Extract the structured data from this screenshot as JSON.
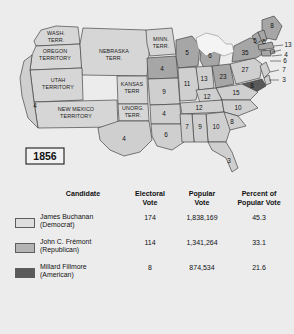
{
  "figure": {
    "year_label": "1856",
    "background_color": "#ececed"
  },
  "map": {
    "title": "1856 United States presidential election electoral map",
    "territory_labels": [
      {
        "name": "washington-territory",
        "lines": [
          "WASH.",
          "TERR."
        ]
      },
      {
        "name": "oregon-territory",
        "lines": [
          "OREGON",
          "TERRITORY"
        ]
      },
      {
        "name": "nebraska-territory",
        "lines": [
          "NEBRASKA",
          "TERR."
        ]
      },
      {
        "name": "minnesota-territory",
        "lines": [
          "MINN.",
          "TERR."
        ]
      },
      {
        "name": "utah-territory",
        "lines": [
          "UTAH",
          "TERRITORY"
        ]
      },
      {
        "name": "kansas-territory",
        "lines": [
          "KANSAS",
          "TERR"
        ]
      },
      {
        "name": "unorganized-territory",
        "lines": [
          "UNORG.",
          "TERR."
        ]
      },
      {
        "name": "new-mexico-territory",
        "lines": [
          "NEW MEXICO",
          "TERRITORY"
        ]
      }
    ],
    "electoral_votes": [
      {
        "state": "california",
        "value": "4",
        "winner": "buchanan"
      },
      {
        "state": "iowa",
        "value": "4",
        "winner": "fremont"
      },
      {
        "state": "wisconsin",
        "value": "5",
        "winner": "fremont"
      },
      {
        "state": "michigan",
        "value": "6",
        "winner": "fremont"
      },
      {
        "state": "missouri",
        "value": "9",
        "winner": "buchanan"
      },
      {
        "state": "illinois",
        "value": "11",
        "winner": "buchanan"
      },
      {
        "state": "indiana",
        "value": "13",
        "winner": "buchanan"
      },
      {
        "state": "ohio",
        "value": "23",
        "winner": "fremont"
      },
      {
        "state": "pennsylvania",
        "value": "27",
        "winner": "buchanan"
      },
      {
        "state": "new-york",
        "value": "35",
        "winner": "fremont"
      },
      {
        "state": "vermont",
        "value": "5",
        "winner": "fremont"
      },
      {
        "state": "new-hampshire",
        "value": "5",
        "winner": "fremont"
      },
      {
        "state": "maine",
        "value": "8",
        "winner": "fremont"
      },
      {
        "state": "massachusetts",
        "value": "13",
        "winner": "fremont"
      },
      {
        "state": "rhode-island",
        "value": "4",
        "winner": "fremont"
      },
      {
        "state": "connecticut",
        "value": "6",
        "winner": "fremont"
      },
      {
        "state": "new-jersey",
        "value": "7",
        "winner": "buchanan"
      },
      {
        "state": "delaware",
        "value": "3",
        "winner": "buchanan"
      },
      {
        "state": "maryland",
        "value": "8",
        "winner": "fillmore"
      },
      {
        "state": "virginia",
        "value": "15",
        "winner": "buchanan"
      },
      {
        "state": "kentucky",
        "value": "12",
        "winner": "buchanan"
      },
      {
        "state": "tennessee",
        "value": "12",
        "winner": "buchanan"
      },
      {
        "state": "north-carolina",
        "value": "10",
        "winner": "buchanan"
      },
      {
        "state": "south-carolina",
        "value": "8",
        "winner": "buchanan"
      },
      {
        "state": "georgia",
        "value": "10",
        "winner": "buchanan"
      },
      {
        "state": "alabama",
        "value": "9",
        "winner": "buchanan"
      },
      {
        "state": "mississippi",
        "value": "7",
        "winner": "buchanan"
      },
      {
        "state": "louisiana",
        "value": "6",
        "winner": "buchanan"
      },
      {
        "state": "arkansas",
        "value": "4",
        "winner": "buchanan"
      },
      {
        "state": "texas",
        "value": "4",
        "winner": "buchanan"
      },
      {
        "state": "florida",
        "value": "3",
        "winner": "buchanan"
      }
    ],
    "colors": {
      "buchanan": "#cfcfcf",
      "fremont": "#a6a6a6",
      "fillmore": "#5a5a5a",
      "territory": "#d6d6d6",
      "water": "#f4f4f4",
      "outline": "#3a3a3a"
    }
  },
  "table": {
    "headers": {
      "candidate": "Candidate",
      "electoral_vote_l1": "Electoral",
      "electoral_vote_l2": "Vote",
      "popular_vote_l1": "Popular",
      "popular_vote_l2": "Vote",
      "percent_l1": "Percent of",
      "percent_l2": "Popular Vote"
    },
    "rows": [
      {
        "swatch_color": "#dedede",
        "name": "James Buchanan",
        "party": "(Democrat)",
        "electoral_vote": "174",
        "popular_vote": "1,838,169",
        "percent_popular_vote": "45.3"
      },
      {
        "swatch_color": "#b4b4b4",
        "name": "John C. Frémont",
        "party": "(Republican)",
        "electoral_vote": "114",
        "popular_vote": "1,341,264",
        "percent_popular_vote": "33.1"
      },
      {
        "swatch_color": "#5a5a5a",
        "name": "Millard Fillmore",
        "party": "(American)",
        "electoral_vote": "8",
        "popular_vote": "874,534",
        "percent_popular_vote": "21.6"
      }
    ]
  }
}
